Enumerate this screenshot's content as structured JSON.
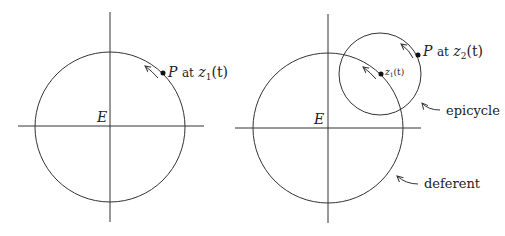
{
  "left_diagram": {
    "center_label": "E",
    "point_label": "P",
    "point_word": "at",
    "point_func": "z",
    "point_sub": "1",
    "point_arg": "(t)"
  },
  "right_diagram": {
    "center_label": "E",
    "point_label": "P",
    "point_word": "at",
    "point_func": "z",
    "point_sub": "2",
    "point_arg": "(t)",
    "epicenter_func": "z",
    "epicenter_sub": "1",
    "epicenter_arg": "(t)",
    "epicycle_label": "epicycle",
    "deferent_label": "deferent"
  },
  "colors": {
    "stroke": "#333333",
    "background": "#ffffff"
  }
}
